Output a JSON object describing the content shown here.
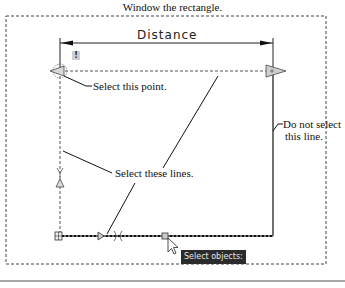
{
  "title": "Window the rectangle.",
  "dimension": {
    "label": "Distance"
  },
  "warning_badge": "!",
  "callouts": {
    "select_point": "Select this point.",
    "select_lines": "Select these lines.",
    "do_not_select_line1": "Do not select",
    "do_not_select_line2": "this line."
  },
  "tooltip": {
    "text": "Select objects:"
  },
  "colors": {
    "line": "#111111",
    "dashed": "#444444",
    "tooltip_bg": "#2b2b2b",
    "rule": "#8a8a8a"
  }
}
